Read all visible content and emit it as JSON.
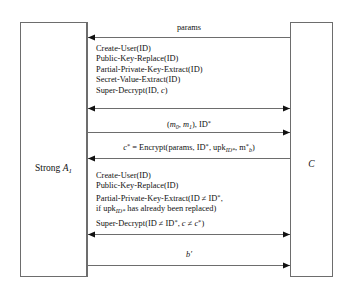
{
  "diagram": {
    "type": "sequence-diagram",
    "stroke_color": "#6d6d6d",
    "text_color": "#111111",
    "background": "#ffffff"
  },
  "actors": {
    "left": {
      "name": "Strong A1",
      "label_prefix": "Strong ",
      "label_symbol": "A",
      "label_subscript": "1"
    },
    "right": {
      "name": "C",
      "label_symbol": "C"
    }
  },
  "messages": [
    {
      "id": "params",
      "label": "params",
      "direction": "left",
      "style": "single"
    },
    {
      "id": "oracle-queries-phase1",
      "direction": "both",
      "style": "double",
      "lines": [
        "Create-User(ID)",
        "Public-Key-Replace(ID)",
        "Partial-Private-Key-Extract(ID)",
        "Secret-Value-Extract(ID)",
        "Super-Decrypt(ID, c)"
      ]
    },
    {
      "id": "challenge-messages",
      "label": "(m0, m1), ID*",
      "direction": "right",
      "style": "single"
    },
    {
      "id": "challenge-ciphertext",
      "label": "c* = Encrypt(params, ID*, upkID*, m*b)",
      "direction": "left",
      "style": "single"
    },
    {
      "id": "oracle-queries-phase2",
      "direction": "both",
      "style": "double",
      "lines": [
        "Create-User(ID)",
        "Public-Key-Replace(ID)",
        "Partial-Private-Key-Extract(ID ≠ ID*,",
        "if upkID* has already been replaced)",
        "Super-Decrypt(ID ≠ ID*, c ≠ c*)"
      ]
    },
    {
      "id": "guess",
      "label": "b'",
      "direction": "right",
      "style": "single"
    }
  ],
  "text": {
    "params": "params",
    "create_user": "Create-User(ID)",
    "public_key_replace": "Public-Key-Replace(ID)",
    "partial_private_key_extract": "Partial-Private-Key-Extract(ID)",
    "secret_value_extract": "Secret-Value-Extract(ID)",
    "super_decrypt": "Super-Decrypt(ID, ",
    "super_decrypt_c": "c",
    "super_decrypt_close": ")",
    "m_open": "(",
    "m_symbol": "m",
    "m_sub0": "0",
    "m_comma": ", ",
    "m_sub1": "1",
    "m_close": "), ID",
    "m_star": "*",
    "enc_c": "c",
    "enc_c_star": "*",
    "enc_eq": " = Encrypt(params, ID",
    "enc_star2": "*",
    "enc_upk": ", upk",
    "enc_upk_sub": "ID*",
    "enc_m": ", m",
    "enc_m_star": "*",
    "enc_m_sub": "b",
    "enc_close": ")",
    "ppke2_a": "Partial-Private-Key-Extract(ID ≠ ID",
    "ppke2_star": "*",
    "ppke2_b": ",",
    "ifupk_a": "if upk",
    "ifupk_sub": "ID*",
    "ifupk_b": " has already been replaced)",
    "sd2_a": "Super-Decrypt(ID ≠ ID",
    "sd2_star": "*",
    "sd2_b": ", ",
    "sd2_c": "c",
    "sd2_neq": " ≠ ",
    "sd2_cstar": "c",
    "sd2_cstar_sup": "*",
    "sd2_close": ")",
    "guess_b": "b",
    "guess_prime": "′"
  }
}
